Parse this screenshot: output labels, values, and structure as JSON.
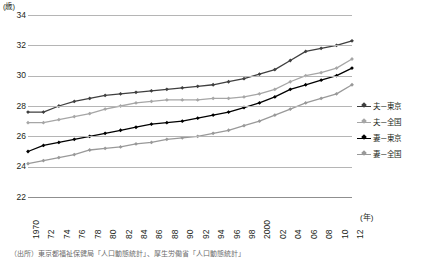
{
  "chart_data": {
    "type": "line",
    "title": "",
    "xlabel": "(年)",
    "ylabel": "(歳)",
    "ylim": [
      22,
      34
    ],
    "yticks": [
      22,
      24,
      26,
      28,
      30,
      32,
      34
    ],
    "ytick_labels": [
      "22",
      "24",
      "26",
      "28",
      "30",
      "32",
      "34"
    ],
    "grid": "horizontal",
    "legend_position": "right",
    "x": [
      1970,
      1972,
      1974,
      1976,
      1978,
      1980,
      1982,
      1984,
      1986,
      1988,
      1990,
      1992,
      1994,
      1996,
      1998,
      2000,
      2002,
      2004,
      2006,
      2008,
      2010,
      2012
    ],
    "xtick_labels": [
      "1970",
      "72",
      "74",
      "76",
      "78",
      "80",
      "82",
      "84",
      "86",
      "88",
      "90",
      "92",
      "94",
      "96",
      "98",
      "2000",
      "02",
      "04",
      "06",
      "08",
      "10",
      "12"
    ],
    "series": [
      {
        "name": "夫－東京",
        "color": "#3f3f3f",
        "values": [
          27.6,
          27.6,
          28.0,
          28.3,
          28.5,
          28.7,
          28.8,
          28.9,
          29.0,
          29.1,
          29.2,
          29.3,
          29.4,
          29.6,
          29.8,
          30.1,
          30.4,
          31.0,
          31.6,
          31.8,
          32.0,
          32.3
        ]
      },
      {
        "name": "夫－全国",
        "color": "#a6a6a6",
        "values": [
          26.9,
          26.9,
          27.1,
          27.3,
          27.5,
          27.8,
          28.0,
          28.2,
          28.3,
          28.4,
          28.4,
          28.4,
          28.5,
          28.5,
          28.6,
          28.8,
          29.1,
          29.6,
          30.0,
          30.2,
          30.5,
          31.1
        ]
      },
      {
        "name": "妻－東京",
        "color": "#000000",
        "values": [
          25.0,
          25.4,
          25.6,
          25.8,
          26.0,
          26.2,
          26.4,
          26.6,
          26.8,
          26.9,
          27.0,
          27.2,
          27.4,
          27.6,
          27.9,
          28.2,
          28.6,
          29.1,
          29.4,
          29.7,
          30.0,
          30.5
        ]
      },
      {
        "name": "妻－全国",
        "color": "#999999",
        "values": [
          24.2,
          24.4,
          24.6,
          24.8,
          25.1,
          25.2,
          25.3,
          25.5,
          25.6,
          25.8,
          25.9,
          26.0,
          26.2,
          26.4,
          26.7,
          27.0,
          27.4,
          27.8,
          28.2,
          28.5,
          28.8,
          29.4
        ]
      }
    ]
  },
  "legend": {
    "items": [
      {
        "label": "夫－東京",
        "color": "#3f3f3f"
      },
      {
        "label": "夫－全国",
        "color": "#a6a6a6"
      },
      {
        "label": "妻－東京",
        "color": "#000000"
      },
      {
        "label": "妻－全国",
        "color": "#999999"
      }
    ]
  },
  "axes": {
    "y_unit": "(歳)",
    "x_unit": "(年)"
  },
  "source_note": "（出所）東京都福祉保健局「人口動態統計」、厚生労働省「人口動態統計」"
}
